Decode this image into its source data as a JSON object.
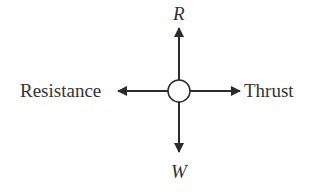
{
  "diagram": {
    "type": "free-body force diagram",
    "labels": {
      "up": "R",
      "down": "W",
      "left": "Resistance",
      "right": "Thrust"
    },
    "colors": {
      "stroke": "#2b2b2b",
      "text": "#333333",
      "background": "#ffffff"
    }
  }
}
